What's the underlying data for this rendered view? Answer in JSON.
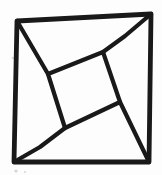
{
  "figure": {
    "name": "pinwheel-dissected-square",
    "background_color": "#fdfdfd",
    "stroke_color": "#191919",
    "speck_color": "#8a8a8a",
    "canvas": {
      "width": 162,
      "height": 175
    },
    "shapes": [
      {
        "name": "outer-square",
        "type": "polygon",
        "stroke_width": 4.8,
        "points": [
          [
            17,
            21
          ],
          [
            151,
            14
          ],
          [
            149,
            162
          ],
          [
            14,
            162
          ]
        ]
      },
      {
        "name": "inner-tilted-square",
        "type": "polygon",
        "stroke_width": 4.2,
        "points": [
          [
            103,
            52
          ],
          [
            120,
            102
          ],
          [
            65,
            128
          ],
          [
            48,
            74
          ]
        ]
      },
      {
        "name": "segment-topleft-corner-to-inner-left-vertex",
        "type": "polyline",
        "stroke_width": 4.2,
        "points": [
          [
            17,
            21
          ],
          [
            48,
            74
          ]
        ]
      },
      {
        "name": "segment-topright-corner-to-inner-top-vertex",
        "type": "polyline",
        "stroke_width": 4.2,
        "points": [
          [
            151,
            14
          ],
          [
            125,
            36
          ],
          [
            103,
            52
          ]
        ]
      },
      {
        "name": "segment-bottomright-corner-to-inner-right-vertex",
        "type": "polyline",
        "stroke_width": 4.2,
        "points": [
          [
            149,
            162
          ],
          [
            120,
            102
          ]
        ]
      },
      {
        "name": "segment-bottomleft-corner-to-inner-bottom-vertex",
        "type": "polyline",
        "stroke_width": 4.2,
        "points": [
          [
            14,
            162
          ],
          [
            40,
            147
          ],
          [
            65,
            128
          ]
        ]
      }
    ],
    "scan_specks": [
      {
        "x": 13,
        "y": 58,
        "r": 1.2
      },
      {
        "x": 16,
        "y": 171,
        "r": 1.6
      },
      {
        "x": 25,
        "y": 172,
        "r": 1.0
      }
    ]
  }
}
